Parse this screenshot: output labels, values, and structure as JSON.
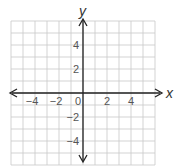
{
  "chart_data": {
    "type": "scatter",
    "title": "",
    "xlabel": "x",
    "ylabel": "y",
    "xlim": [
      -6,
      6
    ],
    "ylim": [
      -6,
      6
    ],
    "grid": true,
    "grid_step": 1,
    "x_tick_labels": [
      "−4",
      "−2",
      "0",
      "2",
      "4"
    ],
    "x_tick_values": [
      -4,
      -2,
      0,
      2,
      4
    ],
    "y_tick_labels": [
      "4",
      "2",
      "−2",
      "−4"
    ],
    "y_tick_values": [
      4,
      2,
      -2,
      -4
    ],
    "series": [],
    "axes_arrows": true
  },
  "colors": {
    "grid": "#c8c8c8",
    "axis": "#222222",
    "label": "#555555"
  }
}
